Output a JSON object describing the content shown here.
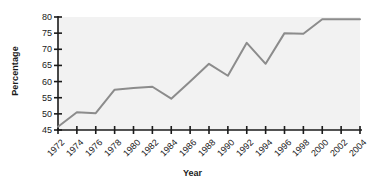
{
  "chart_data": {
    "type": "line",
    "title": "",
    "xlabel": "Year",
    "ylabel": "Percentage",
    "categories": [
      "1972",
      "1974",
      "1976",
      "1978",
      "1980",
      "1982",
      "1984",
      "1986",
      "1988",
      "1990",
      "1992",
      "1994",
      "1996",
      "1998",
      "2000",
      "2002",
      "2004"
    ],
    "x": [
      1972,
      1974,
      1976,
      1978,
      1980,
      1982,
      1984,
      1986,
      1988,
      1990,
      1992,
      1994,
      1996,
      1998,
      2000,
      2002,
      2004
    ],
    "values": [
      46,
      50.5,
      50.2,
      57.5,
      58,
      58.4,
      54.7,
      60,
      65.5,
      61.8,
      72,
      65.5,
      75,
      74.8,
      79.3,
      79.3,
      79.3
    ],
    "series": [
      {
        "name": "Percentage",
        "values": [
          46,
          50.5,
          50.2,
          57.5,
          58,
          58.4,
          54.7,
          60,
          65.5,
          61.8,
          72,
          65.5,
          75,
          74.8,
          79.3,
          79.3,
          79.3
        ]
      }
    ],
    "ylim": [
      45,
      80
    ],
    "yticks": [
      45,
      50,
      55,
      60,
      65,
      70,
      75,
      80
    ],
    "ytick_labels": [
      "45",
      "50",
      "55",
      "60",
      "65",
      "70",
      "75",
      "80"
    ],
    "xlim": [
      1972,
      2004
    ],
    "grid": false,
    "legend": false,
    "legend_position": "none",
    "line_color": "#8c8c8c",
    "axis_color": "#1a1a1a",
    "plot_background": "#f2f2f2",
    "page_background": "#ffffff"
  }
}
